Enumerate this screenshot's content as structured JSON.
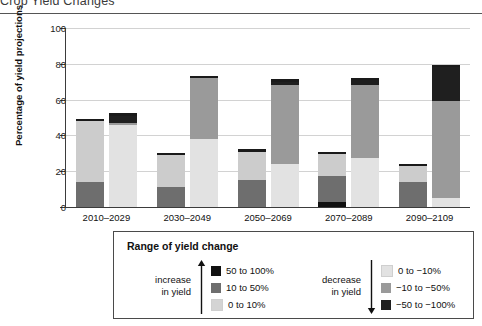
{
  "title": "Crop Yield Changes",
  "chart_data": {
    "type": "bar",
    "title": "Crop Yield Changes",
    "xlabel": "",
    "ylabel": "Percentage of yield projections",
    "ylim": [
      0,
      100
    ],
    "yticks": [
      0,
      20,
      40,
      60,
      80,
      100
    ],
    "grid": true,
    "legend_position": "below-plot",
    "categories": [
      "2010–2029",
      "2030–2049",
      "2050–2069",
      "2070–2089",
      "2090–2109"
    ],
    "bar_pairs": [
      "increase in yield",
      "decrease in yield"
    ],
    "series": [
      {
        "name": "50 to 100%",
        "group": "increase",
        "color": "#111111",
        "values": [
          0,
          0,
          0,
          3,
          0
        ]
      },
      {
        "name": "10 to 50%",
        "group": "increase",
        "color": "#6e6e6e",
        "values": [
          14,
          11,
          15,
          14.5,
          14
        ]
      },
      {
        "name": "0 to 10%",
        "group": "increase",
        "color": "#cccccc",
        "values": [
          34,
          18,
          16,
          12,
          9
        ]
      },
      {
        "name": "0 to −10%",
        "group": "decrease",
        "color": "#e2e2e2",
        "values": [
          46,
          38,
          24,
          27.5,
          5
        ]
      },
      {
        "name": "−10 to −50%",
        "group": "decrease",
        "color": "#9a9a9a",
        "values": [
          1,
          34,
          44,
          40.5,
          54
        ]
      },
      {
        "name": "−50 to −100%",
        "group": "decrease",
        "color": "#1f1f1f",
        "values": [
          4,
          0,
          2,
          3,
          19
        ]
      }
    ],
    "totals": {
      "increase": [
        48,
        29,
        31,
        29.5,
        23
      ],
      "decrease": [
        51,
        72,
        70,
        71,
        78
      ]
    },
    "cap_marker": {
      "color": "#1a1a1a",
      "height_units": 1.3,
      "note": "thin dark rule drawn on top of every bar"
    }
  },
  "axis": {
    "y_tick_labels": [
      "0",
      "20",
      "40",
      "60",
      "80",
      "100"
    ],
    "y_axis_title": "Percentage of yield projections"
  },
  "legend": {
    "title": "Range of yield change",
    "increase": {
      "side_label_line1": "increase",
      "side_label_line2": "in yield",
      "arrow": "arrow-up",
      "items": [
        {
          "label": "50 to 100%",
          "color": "#111111"
        },
        {
          "label": "10 to 50%",
          "color": "#6e6e6e"
        },
        {
          "label": "0 to 10%",
          "color": "#d4d4d4"
        }
      ]
    },
    "decrease": {
      "side_label_line1": "decrease",
      "side_label_line2": "in yield",
      "arrow": "arrow-down",
      "items": [
        {
          "label": "0 to −10%",
          "color": "#e2e2e2"
        },
        {
          "label": "−10 to −50%",
          "color": "#9a9a9a"
        },
        {
          "label": "−50 to −100%",
          "color": "#1f1f1f"
        }
      ]
    }
  },
  "colors": {
    "axis": "#3b3b3b",
    "grid": "#d2d2d2",
    "text": "#111111",
    "rule": "#555555"
  }
}
